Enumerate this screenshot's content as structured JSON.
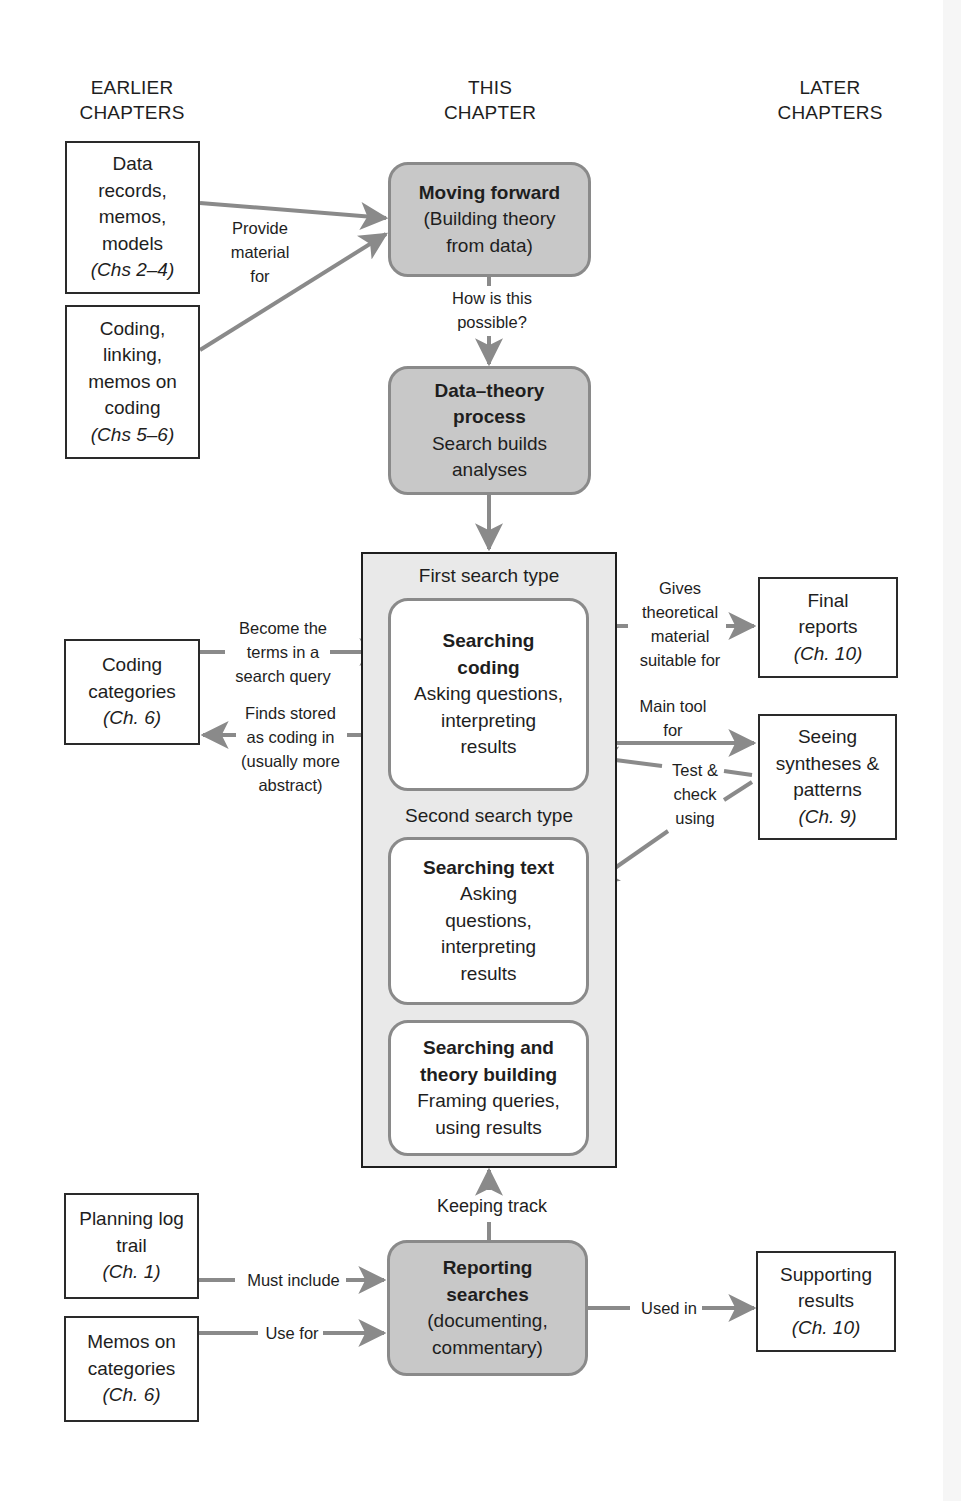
{
  "columns": {
    "earlier": [
      "EARLIER",
      "CHAPTERS"
    ],
    "this": [
      "THIS",
      "CHAPTER"
    ],
    "later": [
      "LATER",
      "CHAPTERS"
    ]
  },
  "left_boxes": [
    {
      "lines": [
        "Data",
        "records,",
        "memos,",
        "models"
      ],
      "chapter": "(Chs 2–4)"
    },
    {
      "lines": [
        "Coding,",
        "linking,",
        "memos on",
        "coding"
      ],
      "chapter": "(Chs 5–6)"
    },
    {
      "lines": [
        "Coding",
        "categories"
      ],
      "chapter": "(Ch. 6)"
    },
    {
      "lines": [
        "Planning log",
        "trail"
      ],
      "chapter": "(Ch. 1)"
    },
    {
      "lines": [
        "Memos on",
        "categories"
      ],
      "chapter": "(Ch. 6)"
    }
  ],
  "right_boxes": [
    {
      "lines": [
        "Final",
        "reports"
      ],
      "chapter": "(Ch. 10)"
    },
    {
      "lines": [
        "Seeing",
        "syntheses &",
        "patterns"
      ],
      "chapter": "(Ch. 9)"
    },
    {
      "lines": [
        "Supporting",
        "results"
      ],
      "chapter": "(Ch. 10)"
    }
  ],
  "center": {
    "moving_forward": {
      "title": "Moving forward",
      "lines": [
        "(Building theory",
        "from data)"
      ]
    },
    "data_theory": {
      "title": [
        "Data–theory",
        "process"
      ],
      "lines": [
        "Search builds",
        "analyses"
      ]
    },
    "container": {
      "first_type": "First search type",
      "second_type": "Second search type",
      "searching_coding": {
        "title": [
          "Searching",
          "coding"
        ],
        "lines": [
          "Asking questions,",
          "interpreting",
          "results"
        ]
      },
      "searching_text": {
        "title": [
          "Searching text"
        ],
        "lines": [
          "Asking",
          "questions,",
          "interpreting",
          "results"
        ]
      },
      "searching_theory": {
        "title": [
          "Searching and",
          "theory building"
        ],
        "lines": [
          "Framing queries,",
          "using results"
        ]
      }
    },
    "reporting": {
      "title": [
        "Reporting",
        "searches"
      ],
      "lines": [
        "(documenting,",
        "commentary)"
      ]
    }
  },
  "labels": {
    "provide": [
      "Provide",
      "material",
      "for"
    ],
    "how_possible": [
      "How is this",
      "possible?"
    ],
    "become_terms": [
      "Become the",
      "terms in a",
      "search query"
    ],
    "finds_stored": [
      "Finds stored",
      "as coding in",
      "(usually more",
      "abstract)"
    ],
    "gives_theoretical": [
      "Gives",
      "theoretical",
      "material",
      "suitable for"
    ],
    "main_tool": [
      "Main tool",
      "for"
    ],
    "test_check": [
      "Test &",
      "check",
      "using"
    ],
    "keeping_track": "Keeping track",
    "must_include": "Must include",
    "use_for": "Use for",
    "used_in": "Used in"
  },
  "colors": {
    "arrow": "#8a8a8a",
    "grey_box": "#c8c8c8",
    "container_bg": "#e9e9e9",
    "border_dark": "#1e1e1e"
  }
}
